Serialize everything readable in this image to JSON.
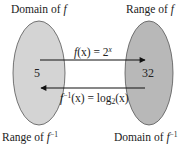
{
  "labels": {
    "top_left_prefix": "Domain of ",
    "top_left_var": "f",
    "top_right_prefix": "Range of ",
    "top_right_var": "f",
    "bottom_left_prefix": "Range of ",
    "bottom_left_var": "f",
    "bottom_left_sup": "−1",
    "bottom_right_prefix": "Domain of ",
    "bottom_right_var": "f",
    "bottom_right_sup": "−1"
  },
  "values": {
    "left": "5",
    "right": "32"
  },
  "arrows": {
    "forward": {
      "fn": "f",
      "arg": "(x) = 2",
      "exp": "x"
    },
    "inverse": {
      "fn": "f",
      "sup": "−1",
      "mid": "(x) = log",
      "base": "2",
      "arg": "(x)"
    }
  },
  "colors": {
    "left_set": "#d4d4d4",
    "right_set": "#b8b8b8",
    "stroke": "#555555",
    "arrow": "#111111"
  }
}
